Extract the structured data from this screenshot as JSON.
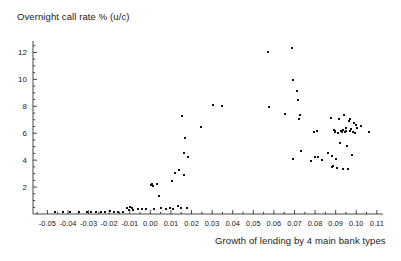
{
  "chart": {
    "title": "Overnight call rate % (u/c)",
    "xlabel": "Growth of lending by 4 main bank types",
    "ylabel": "Overnight call rate % (u/c)"
  },
  "chart_data": {
    "type": "scatter",
    "title": "Overnight call rate % (u/c)",
    "xlabel": "Growth of lending by 4 main bank types",
    "ylabel": "Overnight call rate % (u/c)",
    "xlim": [
      -0.057,
      0.113
    ],
    "ylim": [
      0,
      12.7
    ],
    "grid": false,
    "legend": null,
    "xticks": [
      -0.05,
      -0.04,
      -0.03,
      -0.02,
      -0.01,
      0.0,
      0.01,
      0.02,
      0.03,
      0.04,
      0.05,
      0.06,
      0.07,
      0.08,
      0.09,
      0.1,
      0.11
    ],
    "xticklabels": [
      "-0.05",
      "-0.04",
      "-0.03",
      "-0.02",
      "-0.01",
      "0.00",
      "0.01",
      "0.02",
      "0.03",
      "0.04",
      "0.05",
      "0.06",
      "0.07",
      "0.08",
      "0.09",
      "0.10",
      "0.11"
    ],
    "yticks": [
      2,
      4,
      6,
      8,
      10,
      12
    ],
    "yticklabels": [
      "2",
      "4",
      "6",
      "8",
      "10",
      "12"
    ],
    "minor_ticks": true,
    "marker": "dot",
    "marker_color": "#111111",
    "points": [
      [
        -0.0465,
        0.12
      ],
      [
        -0.0425,
        0.12
      ],
      [
        -0.039,
        0.14
      ],
      [
        -0.0345,
        0.12
      ],
      [
        -0.031,
        0.12
      ],
      [
        -0.0288,
        0.14
      ],
      [
        -0.0262,
        0.12
      ],
      [
        -0.024,
        0.14
      ],
      [
        -0.0218,
        0.12
      ],
      [
        -0.0196,
        0.2
      ],
      [
        -0.0178,
        0.14
      ],
      [
        -0.0156,
        0.12
      ],
      [
        -0.0132,
        0.14
      ],
      [
        -0.0112,
        0.42
      ],
      [
        -0.0104,
        0.3
      ],
      [
        -0.0098,
        0.5
      ],
      [
        -0.009,
        0.45
      ],
      [
        -0.0082,
        0.28
      ],
      [
        -0.006,
        0.38
      ],
      [
        -0.004,
        0.4
      ],
      [
        -0.002,
        0.38
      ],
      [
        0.0002,
        2.18
      ],
      [
        0.0008,
        2.22
      ],
      [
        0.0012,
        2.08
      ],
      [
        0.002,
        0.4
      ],
      [
        0.0034,
        2.26
      ],
      [
        0.004,
        1.32
      ],
      [
        0.0052,
        0.42
      ],
      [
        0.0074,
        0.38
      ],
      [
        0.0096,
        0.42
      ],
      [
        0.0104,
        2.44
      ],
      [
        0.0112,
        0.4
      ],
      [
        0.0122,
        3.02
      ],
      [
        0.0132,
        0.62
      ],
      [
        0.014,
        3.28
      ],
      [
        0.0148,
        0.42
      ],
      [
        0.0156,
        7.3
      ],
      [
        0.0162,
        4.52
      ],
      [
        0.0164,
        2.88
      ],
      [
        0.017,
        5.62
      ],
      [
        0.0176,
        0.42
      ],
      [
        0.0182,
        4.24
      ],
      [
        0.0246,
        6.48
      ],
      [
        0.0302,
        8.06
      ],
      [
        0.0348,
        8.04
      ],
      [
        0.0572,
        12.02
      ],
      [
        0.0576,
        7.98
      ],
      [
        0.0656,
        7.44
      ],
      [
        0.0686,
        12.36
      ],
      [
        0.0692,
        9.92
      ],
      [
        0.0694,
        4.1
      ],
      [
        0.0714,
        9.1
      ],
      [
        0.0718,
        8.44
      ],
      [
        0.0722,
        7.04
      ],
      [
        0.0726,
        7.34
      ],
      [
        0.073,
        4.68
      ],
      [
        0.0782,
        3.92
      ],
      [
        0.0796,
        6.12
      ],
      [
        0.0802,
        4.24
      ],
      [
        0.0808,
        6.14
      ],
      [
        0.0812,
        4.26
      ],
      [
        0.0836,
        4.04
      ],
      [
        0.0862,
        4.56
      ],
      [
        0.0876,
        7.14
      ],
      [
        0.088,
        4.34
      ],
      [
        0.0884,
        3.48
      ],
      [
        0.0888,
        3.58
      ],
      [
        0.0892,
        6.22
      ],
      [
        0.0896,
        6.08
      ],
      [
        0.0898,
        6.18
      ],
      [
        0.0902,
        4.12
      ],
      [
        0.0908,
        3.44
      ],
      [
        0.0912,
        6.02
      ],
      [
        0.0916,
        7.02
      ],
      [
        0.092,
        5.24
      ],
      [
        0.0924,
        6.14
      ],
      [
        0.093,
        6.1
      ],
      [
        0.0934,
        3.32
      ],
      [
        0.0938,
        6.22
      ],
      [
        0.0942,
        7.36
      ],
      [
        0.0946,
        6.06
      ],
      [
        0.095,
        6.42
      ],
      [
        0.0952,
        6.18
      ],
      [
        0.0956,
        5.06
      ],
      [
        0.096,
        3.36
      ],
      [
        0.0964,
        6.88
      ],
      [
        0.0968,
        6.2
      ],
      [
        0.0972,
        7.06
      ],
      [
        0.0976,
        6.3
      ],
      [
        0.098,
        4.38
      ],
      [
        0.0984,
        6.1
      ],
      [
        0.0988,
        6.76
      ],
      [
        0.0992,
        6.0
      ],
      [
        0.0998,
        6.6
      ],
      [
        0.1002,
        6.4
      ],
      [
        0.1022,
        6.52
      ],
      [
        0.1064,
        6.12
      ]
    ]
  }
}
